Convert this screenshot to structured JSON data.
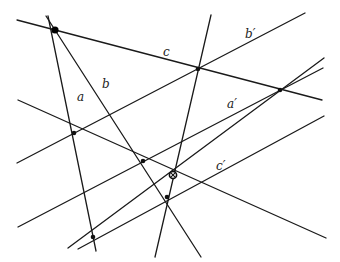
{
  "diagram": {
    "type": "projective-configuration",
    "background": "#ffffff",
    "stroke_color": "#1a1a1a",
    "lines": [
      {
        "id": "c",
        "label": "c",
        "x1": 17,
        "y1": 20,
        "x2": 322,
        "y2": 100
      },
      {
        "id": "a",
        "label": "a",
        "x1": 48,
        "y1": 16,
        "x2": 96,
        "y2": 251
      },
      {
        "id": "b",
        "label": "b",
        "x1": 46,
        "y1": 16,
        "x2": 201,
        "y2": 257
      },
      {
        "id": "b'",
        "label": "b'",
        "x1": 17,
        "y1": 163,
        "x2": 305,
        "y2": 13
      },
      {
        "id": "a'",
        "label": "a'",
        "x1": 18,
        "y1": 227,
        "x2": 323,
        "y2": 68
      },
      {
        "id": "c'",
        "label": "c'",
        "x1": 18,
        "y1": 100,
        "x2": 326,
        "y2": 238
      },
      {
        "id": "l7",
        "label": "",
        "x1": 155,
        "y1": 257,
        "x2": 211,
        "y2": 15
      },
      {
        "id": "l8",
        "label": "",
        "x1": 68,
        "y1": 248,
        "x2": 324,
        "y2": 58
      },
      {
        "id": "l9",
        "label": "",
        "x1": 78,
        "y1": 249,
        "x2": 324,
        "y2": 116
      }
    ],
    "points": [
      {
        "id": "P",
        "x": 55,
        "y": 30,
        "style": "big"
      },
      {
        "id": "A",
        "x": 74,
        "y": 133,
        "style": "dot"
      },
      {
        "id": "B",
        "x": 143,
        "y": 161,
        "style": "dot"
      },
      {
        "id": "O",
        "x": 173,
        "y": 175,
        "style": "ring"
      },
      {
        "id": "C",
        "x": 167,
        "y": 197,
        "style": "dot"
      },
      {
        "id": "D",
        "x": 93,
        "y": 237,
        "style": "dot"
      },
      {
        "id": "E",
        "x": 198,
        "y": 69,
        "style": "dot"
      },
      {
        "id": "F",
        "x": 280,
        "y": 90,
        "style": "dot"
      }
    ],
    "labels": [
      {
        "text": "c",
        "x": 163,
        "y": 46
      },
      {
        "text": "b′",
        "x": 245,
        "y": 28
      },
      {
        "text": "a",
        "x": 77,
        "y": 91
      },
      {
        "text": "b",
        "x": 102,
        "y": 78
      },
      {
        "text": "a′",
        "x": 227,
        "y": 98
      },
      {
        "text": "c′",
        "x": 216,
        "y": 160
      }
    ]
  }
}
